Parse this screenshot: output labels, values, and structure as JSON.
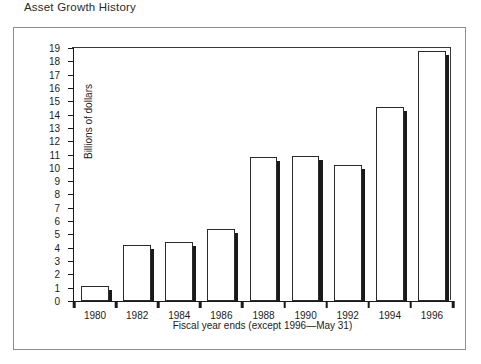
{
  "figure": {
    "title": "Asset Growth History"
  },
  "chart_data": {
    "type": "bar",
    "title": "Asset Growth History",
    "xlabel": "Fiscal year ends (except 1996—May 31)",
    "ylabel": "Billions of dollars",
    "categories": [
      "1980",
      "1982",
      "1984",
      "1986",
      "1988",
      "1990",
      "1992",
      "1994",
      "1996"
    ],
    "values": [
      1.1,
      4.2,
      4.4,
      5.4,
      10.8,
      10.9,
      10.2,
      14.6,
      18.8
    ],
    "ylim": [
      0,
      19
    ],
    "ytick_step": 1,
    "yticks": [
      "0",
      "1",
      "2",
      "3",
      "4",
      "5",
      "6",
      "7",
      "8",
      "9",
      "10",
      "11",
      "12",
      "13",
      "14",
      "15",
      "16",
      "17",
      "18",
      "19"
    ],
    "grid": false,
    "legend": "none",
    "bar_style": "white fill, black outline, right-side drop shadow"
  }
}
